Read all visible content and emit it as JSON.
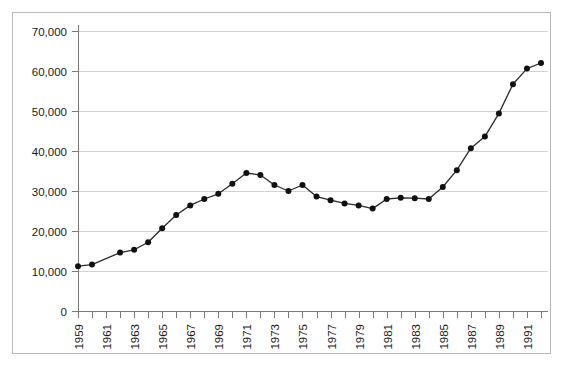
{
  "chart_data": {
    "type": "line",
    "title": "",
    "subtitle": "",
    "xlabel": "",
    "ylabel": "",
    "xlim": [
      1959,
      1992
    ],
    "ylim": [
      0,
      70000
    ],
    "grid": true,
    "legend": "none",
    "y_ticks": [
      0,
      10000,
      20000,
      30000,
      40000,
      50000,
      60000,
      70000
    ],
    "y_tick_labels": [
      "0",
      "10,000",
      "20,000",
      "30,000",
      "40,000",
      "50,000",
      "60,000",
      "70,000"
    ],
    "x_ticks": [
      1959,
      1960,
      1961,
      1962,
      1963,
      1964,
      1965,
      1966,
      1967,
      1968,
      1969,
      1970,
      1971,
      1972,
      1973,
      1974,
      1975,
      1976,
      1977,
      1978,
      1979,
      1980,
      1981,
      1982,
      1983,
      1984,
      1985,
      1986,
      1987,
      1988,
      1989,
      1990,
      1991,
      1992
    ],
    "x_tick_labels": [
      "1959",
      "",
      "1961",
      "",
      "1963",
      "",
      "1965",
      "",
      "1967",
      "",
      "1969",
      "",
      "1971",
      "",
      "1973",
      "",
      "1975",
      "",
      "1977",
      "",
      "1979",
      "",
      "1981",
      "",
      "1983",
      "",
      "1985",
      "",
      "1987",
      "",
      "1989",
      "",
      "1991",
      ""
    ],
    "x": [
      1959,
      1960,
      1962,
      1963,
      1964,
      1965,
      1966,
      1967,
      1968,
      1969,
      1970,
      1971,
      1972,
      1973,
      1974,
      1975,
      1976,
      1977,
      1978,
      1979,
      1980,
      1981,
      1982,
      1983,
      1984,
      1985,
      1986,
      1987,
      1988,
      1989,
      1990,
      1991,
      1992
    ],
    "values": [
      11200,
      11600,
      14600,
      15300,
      17200,
      20700,
      24000,
      26400,
      28000,
      29300,
      31800,
      34500,
      34000,
      31500,
      30000,
      31500,
      28600,
      27700,
      26900,
      26400,
      25600,
      28000,
      28300,
      28200,
      28000,
      31000,
      35200,
      40700,
      43600,
      49400,
      56700,
      60600,
      62000
    ],
    "series": [
      {
        "name": "series-1",
        "color": "#111111",
        "marker": "circle",
        "values": [
          11200,
          11600,
          14600,
          15300,
          17200,
          20700,
          24000,
          26400,
          28000,
          29300,
          31800,
          34500,
          34000,
          31500,
          30000,
          31500,
          28600,
          27700,
          26900,
          26400,
          25600,
          28000,
          28300,
          28200,
          28000,
          31000,
          35200,
          40700,
          43600,
          49400,
          56700,
          60600,
          62000
        ]
      }
    ],
    "colors": {
      "line": "#2b2b2b",
      "marker": "#111111",
      "gridline": "#d2d2d2",
      "axis": "#7a7a7a",
      "frame": "#b9b9b9",
      "background": "#ffffff",
      "text": "#1a1a1a"
    }
  }
}
